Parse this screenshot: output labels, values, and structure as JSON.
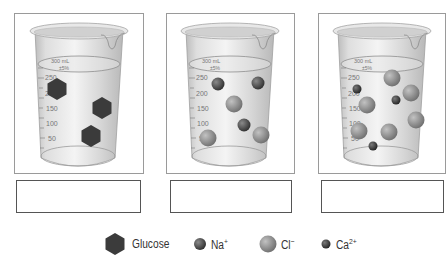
{
  "beakers": [
    {
      "id": "beaker-glucose",
      "frame": {
        "x": 14,
        "y": 13,
        "w": 130,
        "h": 161
      },
      "answer_box": {
        "x": 16,
        "y": 180,
        "w": 125,
        "h": 33,
        "value": ""
      },
      "markings": {
        "top": "300 mL",
        "tolerance": "±5%",
        "ticks": [
          "250",
          "200",
          "150",
          "100",
          "50"
        ]
      },
      "particles": [
        {
          "type": "glucose",
          "cx": 57,
          "cy": 89
        },
        {
          "type": "glucose",
          "cx": 102,
          "cy": 108
        },
        {
          "type": "glucose",
          "cx": 91,
          "cy": 136
        }
      ]
    },
    {
      "id": "beaker-nacl",
      "frame": {
        "x": 166,
        "y": 13,
        "w": 129,
        "h": 161
      },
      "answer_box": {
        "x": 170,
        "y": 180,
        "w": 122,
        "h": 33,
        "value": ""
      },
      "markings": {
        "top": "300 mL",
        "tolerance": "±5%",
        "ticks": [
          "250",
          "200",
          "150",
          "100",
          "50"
        ]
      },
      "particles": [
        {
          "type": "na",
          "cx": 218,
          "cy": 84
        },
        {
          "type": "na",
          "cx": 258,
          "cy": 83
        },
        {
          "type": "cl",
          "cx": 234,
          "cy": 104
        },
        {
          "type": "na",
          "cx": 244,
          "cy": 125
        },
        {
          "type": "cl",
          "cx": 208,
          "cy": 138
        },
        {
          "type": "cl",
          "cx": 261,
          "cy": 135
        }
      ]
    },
    {
      "id": "beaker-cacl2",
      "frame": {
        "x": 318,
        "y": 13,
        "w": 128,
        "h": 161
      },
      "answer_box": {
        "x": 321,
        "y": 180,
        "w": 123,
        "h": 33,
        "value": ""
      },
      "markings": {
        "top": "300 mL",
        "tolerance": "±5%",
        "ticks": [
          "250",
          "200",
          "150",
          "100",
          "50"
        ]
      },
      "particles": [
        {
          "type": "cl",
          "cx": 392,
          "cy": 78
        },
        {
          "type": "ca",
          "cx": 357,
          "cy": 89
        },
        {
          "type": "cl",
          "cx": 411,
          "cy": 93
        },
        {
          "type": "ca",
          "cx": 396,
          "cy": 100
        },
        {
          "type": "cl",
          "cx": 367,
          "cy": 105
        },
        {
          "type": "cl",
          "cx": 416,
          "cy": 120
        },
        {
          "type": "cl",
          "cx": 359,
          "cy": 131
        },
        {
          "type": "cl",
          "cx": 389,
          "cy": 132
        },
        {
          "type": "ca",
          "cx": 373,
          "cy": 146
        }
      ]
    }
  ],
  "legend": {
    "items": [
      {
        "key": "glucose",
        "label": "Glucose",
        "sup": ""
      },
      {
        "key": "na",
        "label": "Na",
        "sup": "+"
      },
      {
        "key": "cl",
        "label": "Cl",
        "sup": "−"
      },
      {
        "key": "ca",
        "label": "Ca",
        "sup": "2+"
      }
    ]
  },
  "colors": {
    "glucose": "#3b3b3b",
    "na": "#4a4a4a",
    "cl": "#8c8c8c",
    "ca": "#3a3a3a",
    "frame_border": "#9a9a9a",
    "box_border": "#555555",
    "glass": "#d8d8d8"
  }
}
